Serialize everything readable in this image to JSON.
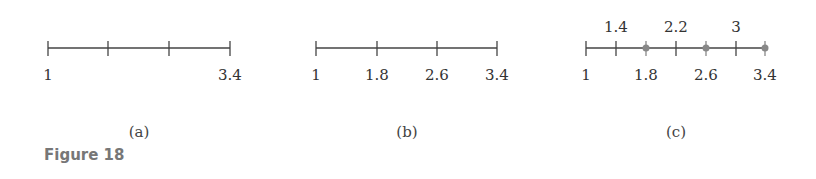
{
  "figure": {
    "label": "Figure 18",
    "panels": [
      {
        "caption": "(a)",
        "range": [
          1,
          3.4
        ],
        "ticks": [
          1,
          1.8,
          2.6,
          3.4
        ],
        "labels_below": [
          "1",
          "3.4"
        ],
        "labels_above": [],
        "dots": []
      },
      {
        "caption": "(b)",
        "range": [
          1,
          3.4
        ],
        "ticks": [
          1,
          1.8,
          2.6,
          3.4
        ],
        "labels_below": [
          "1",
          "1.8",
          "2.6",
          "3.4"
        ],
        "labels_above": [],
        "dots": []
      },
      {
        "caption": "(c)",
        "range": [
          1,
          3.4
        ],
        "ticks": [
          1,
          1.4,
          1.8,
          2.2,
          2.6,
          3,
          3.4
        ],
        "labels_below": [
          "1",
          "1.8",
          "2.6",
          "3.4"
        ],
        "labels_above": [
          "1.4",
          "2.2",
          "3"
        ],
        "dots": [
          1.8,
          2.6,
          3.4
        ]
      }
    ]
  },
  "text": {
    "a_lbl_1": "1",
    "a_lbl_34": "3.4",
    "a_cap": "(a)",
    "b_lbl_1": "1",
    "b_lbl_18": "1.8",
    "b_lbl_26": "2.6",
    "b_lbl_34": "3.4",
    "b_cap": "(b)",
    "c_lbl_1": "1",
    "c_lbl_18": "1.8",
    "c_lbl_26": "2.6",
    "c_lbl_34": "3.4",
    "c_lbl_14": "1.4",
    "c_lbl_22": "2.2",
    "c_lbl_3": "3",
    "c_cap": "(c)"
  },
  "colors": {
    "line": "#444444",
    "dot": "#888888"
  }
}
